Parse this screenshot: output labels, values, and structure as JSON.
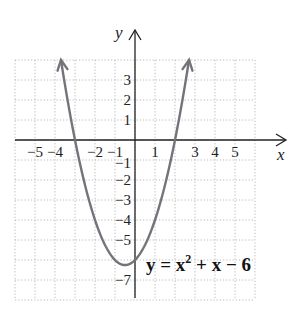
{
  "chart_data": {
    "type": "line",
    "title": "",
    "xlabel": "x",
    "ylabel": "y",
    "xlim": [
      -6,
      6
    ],
    "ylim": [
      -8,
      4
    ],
    "grid": true,
    "x_tick_labels": [
      "-5",
      "-4",
      "-2",
      "-1",
      "1",
      "3",
      "4",
      "5"
    ],
    "y_tick_labels": [
      "3",
      "2",
      "1",
      "-1",
      "-2",
      "-3",
      "-4",
      "-5",
      "-7"
    ],
    "series": [
      {
        "name": "y = x^2 + x - 6",
        "equation": "y = x^2 + x - 6",
        "color": "#76727a",
        "x": [
          -3.7,
          -3,
          -2,
          -1,
          -0.5,
          0,
          1,
          2,
          2.7
        ],
        "values": [
          4,
          0,
          -4,
          -6,
          -6.25,
          -6,
          -4,
          0,
          4
        ],
        "arrows_at_ends": true
      }
    ],
    "annotations": [
      {
        "text": "y = x² + x − 6",
        "at": [
          0.5,
          -6.5
        ]
      }
    ]
  },
  "labels": {
    "x_axis": "x",
    "y_axis": "y",
    "equation_parts": {
      "lhs": "y = x",
      "exp": "2",
      "rhs": " + x − 6"
    },
    "x_ticks": [
      {
        "text": "−5",
        "v": -5
      },
      {
        "text": "−4",
        "v": -4
      },
      {
        "text": "−2",
        "v": -2
      },
      {
        "text": "−1",
        "v": -1
      },
      {
        "text": "1",
        "v": 1
      },
      {
        "text": "3",
        "v": 3
      },
      {
        "text": "4",
        "v": 4
      },
      {
        "text": "5",
        "v": 5
      }
    ],
    "y_ticks": [
      {
        "text": "3",
        "v": 3
      },
      {
        "text": "2",
        "v": 2
      },
      {
        "text": "1",
        "v": 1
      },
      {
        "text": "−1",
        "v": -1
      },
      {
        "text": "−2",
        "v": -2
      },
      {
        "text": "−3",
        "v": -3
      },
      {
        "text": "−4",
        "v": -4
      },
      {
        "text": "−5",
        "v": -5
      },
      {
        "text": "−7",
        "v": -7
      }
    ]
  }
}
